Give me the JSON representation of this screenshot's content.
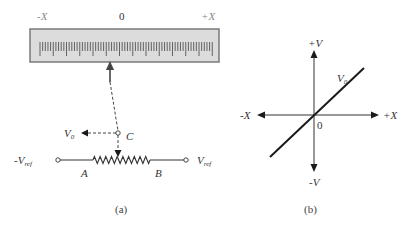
{
  "panel_a": {
    "scale": {
      "left_label": "-X",
      "center_label": "0",
      "right_label": "+X",
      "box": {
        "x": 30,
        "y": 29,
        "width": 189,
        "height": 33
      },
      "fill_color": "#dcdcdc",
      "border_color": "#7a7a7a",
      "tick_start_x": 40,
      "tick_spacing": 2.65,
      "tick_count": 66,
      "major_every": 5
    },
    "pointer_arrow": {
      "tip_x": 110,
      "tip_y": 61,
      "tail_x": 110,
      "tail_y": 82
    },
    "terminal_c": {
      "label": "C",
      "x": 118,
      "y": 133
    },
    "output": {
      "label": "V",
      "subscript": "0"
    },
    "resistor": {
      "start_x": 93,
      "end_x": 150,
      "y": 160,
      "peaks": 10
    },
    "left_terminal": {
      "label": "-V",
      "subscript": "ref",
      "x": 58,
      "y": 160
    },
    "right_terminal": {
      "label": "V",
      "subscript": "ref",
      "x": 186,
      "y": 160
    },
    "node_a": "A",
    "node_b": "B",
    "caption": "(a)"
  },
  "panel_b": {
    "origin": {
      "x": 314,
      "y": 115
    },
    "axis_labels": {
      "pos_y": "+V",
      "neg_y": "-V",
      "pos_x": "+X",
      "neg_x": "-X",
      "origin": "0"
    },
    "line_label": {
      "main": "V",
      "subscript": "0"
    },
    "caption": "(b)"
  },
  "colors": {
    "line": "#1a1a1a",
    "text": "#333333",
    "muted_text": "#8a8a8a"
  }
}
